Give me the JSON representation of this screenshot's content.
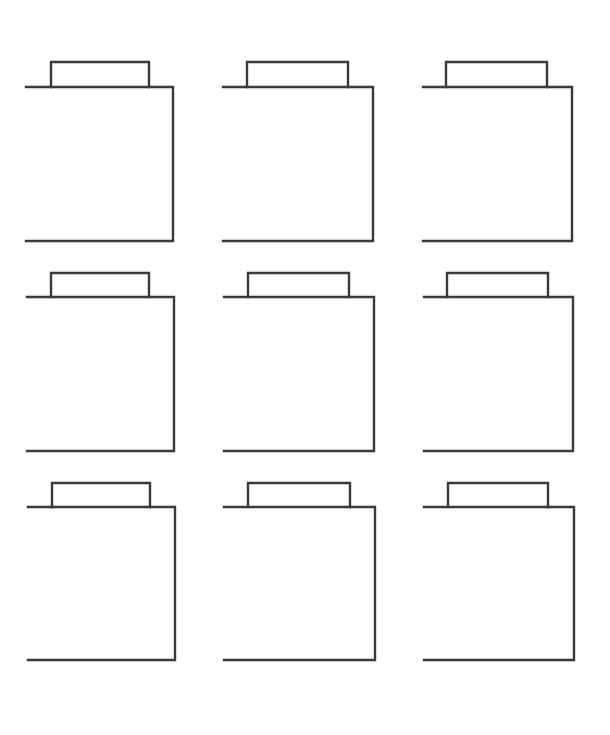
{
  "canvas": {
    "width": 610,
    "height": 735,
    "background": "#ffffff"
  },
  "style": {
    "stroke_color": "#3a3a3a",
    "stroke_width": 2.4
  },
  "shape_description": "Open-left box with a tab on top (folder / container outline)",
  "shapes": [
    {
      "id": "r1c1",
      "row": 1,
      "col": 1,
      "left": 26,
      "right": 173,
      "top": 87,
      "bottom": 241,
      "tab_left": 51,
      "tab_right": 149,
      "tab_top": 62
    },
    {
      "id": "r1c2",
      "row": 1,
      "col": 2,
      "left": 223,
      "right": 373,
      "top": 87,
      "bottom": 241,
      "tab_left": 247,
      "tab_right": 348,
      "tab_top": 62
    },
    {
      "id": "r1c3",
      "row": 1,
      "col": 3,
      "left": 423,
      "right": 572,
      "top": 87,
      "bottom": 241,
      "tab_left": 446,
      "tab_right": 547,
      "tab_top": 62
    },
    {
      "id": "r2c1",
      "row": 2,
      "col": 1,
      "left": 27,
      "right": 174,
      "top": 297,
      "bottom": 451,
      "tab_left": 51,
      "tab_right": 149,
      "tab_top": 273
    },
    {
      "id": "r2c2",
      "row": 2,
      "col": 2,
      "left": 224,
      "right": 374,
      "top": 297,
      "bottom": 451,
      "tab_left": 248,
      "tab_right": 349,
      "tab_top": 273
    },
    {
      "id": "r2c3",
      "row": 2,
      "col": 3,
      "left": 424,
      "right": 573,
      "top": 297,
      "bottom": 451,
      "tab_left": 447,
      "tab_right": 548,
      "tab_top": 273
    },
    {
      "id": "r3c1",
      "row": 3,
      "col": 1,
      "left": 28,
      "right": 175,
      "top": 507,
      "bottom": 660,
      "tab_left": 52,
      "tab_right": 150,
      "tab_top": 483
    },
    {
      "id": "r3c2",
      "row": 3,
      "col": 2,
      "left": 224,
      "right": 375,
      "top": 507,
      "bottom": 660,
      "tab_left": 248,
      "tab_right": 350,
      "tab_top": 483
    },
    {
      "id": "r3c3",
      "row": 3,
      "col": 3,
      "left": 424,
      "right": 574,
      "top": 507,
      "bottom": 660,
      "tab_left": 448,
      "tab_right": 548,
      "tab_top": 483
    }
  ]
}
